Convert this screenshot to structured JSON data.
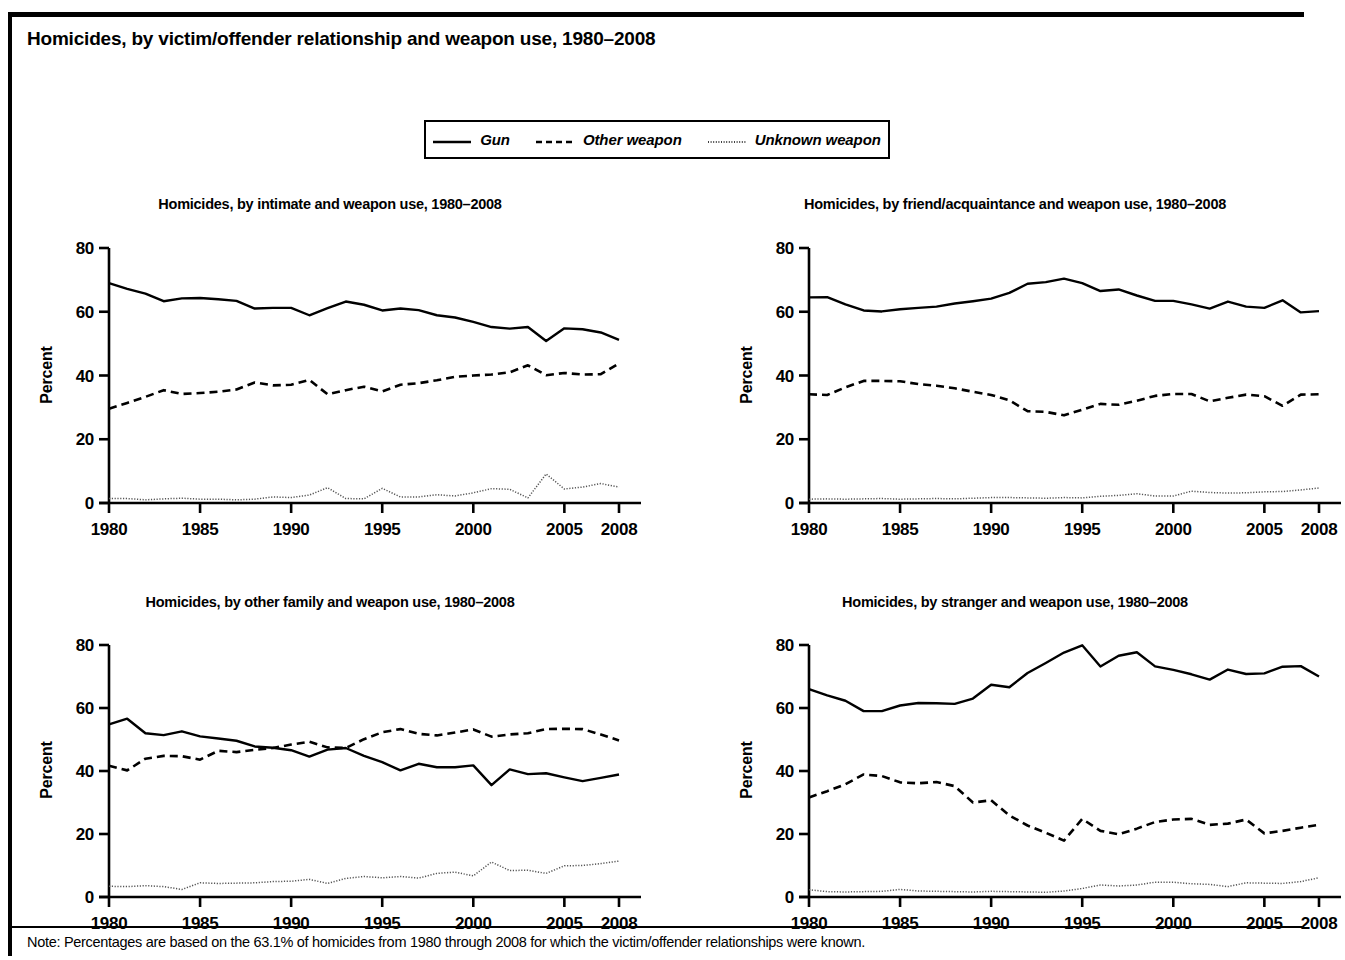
{
  "figure": {
    "title": "Homicides, by victim/offender relationship and weapon use, 1980–2008",
    "note": "Note: Percentages are based on the 63.1% of homicides from 1980 through 2008 for which the victim/offender relationships were known."
  },
  "legend": {
    "items": [
      {
        "label": "Gun",
        "style": "solid",
        "icon": "solid-line-icon"
      },
      {
        "label": "Other weapon",
        "style": "dashed",
        "icon": "dashed-line-icon"
      },
      {
        "label": "Unknown weapon",
        "style": "dotted",
        "icon": "dotted-line-icon"
      }
    ]
  },
  "axes": {
    "ylabel": "Percent",
    "yticks": [
      0,
      20,
      40,
      60,
      80
    ],
    "ylim": [
      0,
      80
    ],
    "xticks": [
      1980,
      1985,
      1990,
      1995,
      2000,
      2005,
      2008
    ],
    "xlim": [
      1980,
      2008
    ],
    "grid": false
  },
  "chart_data": [
    {
      "type": "line",
      "id": "intimate",
      "title": "Homicides, by intimate and weapon use, 1980–2008",
      "xlabel": "",
      "ylabel": "Percent",
      "ylim": [
        0,
        80
      ],
      "xlim": [
        1980,
        2008
      ],
      "grid": false,
      "legend_position": "figure-top",
      "x": [
        1980,
        1981,
        1982,
        1983,
        1984,
        1985,
        1986,
        1987,
        1988,
        1989,
        1990,
        1991,
        1992,
        1993,
        1994,
        1995,
        1996,
        1997,
        1998,
        1999,
        2000,
        2001,
        2002,
        2003,
        2004,
        2005,
        2006,
        2007,
        2008
      ],
      "series": [
        {
          "name": "Gun",
          "style": "solid",
          "values": [
            69.0,
            67.2,
            65.7,
            63.3,
            64.2,
            64.3,
            63.9,
            63.4,
            61.0,
            61.2,
            61.2,
            58.9,
            61.1,
            63.2,
            62.2,
            60.4,
            61.0,
            60.5,
            58.9,
            58.2,
            56.8,
            55.2,
            54.7,
            55.2,
            50.8,
            54.8,
            54.5,
            53.5,
            51.2
          ]
        },
        {
          "name": "Other weapon",
          "style": "dashed",
          "values": [
            29.6,
            31.4,
            33.3,
            35.4,
            34.2,
            34.5,
            34.9,
            35.6,
            37.8,
            36.9,
            37.1,
            38.6,
            34.1,
            35.4,
            36.5,
            35.0,
            37.1,
            37.6,
            38.5,
            39.6,
            40.0,
            40.3,
            41.0,
            43.2,
            40.1,
            40.8,
            40.3,
            40.4,
            43.8
          ]
        },
        {
          "name": "Unknown weapon",
          "style": "dotted",
          "values": [
            1.4,
            1.4,
            1.0,
            1.3,
            1.5,
            1.2,
            1.2,
            1.0,
            1.2,
            1.9,
            1.7,
            2.5,
            4.8,
            1.4,
            1.3,
            4.6,
            1.9,
            1.9,
            2.6,
            2.2,
            3.2,
            4.5,
            4.3,
            1.6,
            9.1,
            4.4,
            5.0,
            6.1,
            5.0
          ]
        }
      ]
    },
    {
      "type": "line",
      "id": "friend-acquaintance",
      "title": "Homicides, by friend/acquaintance and weapon use, 1980–2008",
      "xlabel": "",
      "ylabel": "Percent",
      "ylim": [
        0,
        80
      ],
      "xlim": [
        1980,
        2008
      ],
      "grid": false,
      "legend_position": "figure-top",
      "x": [
        1980,
        1981,
        1982,
        1983,
        1984,
        1985,
        1986,
        1987,
        1988,
        1989,
        1990,
        1991,
        1992,
        1993,
        1994,
        1995,
        1996,
        1997,
        1998,
        1999,
        2000,
        2001,
        2002,
        2003,
        2004,
        2005,
        2006,
        2007,
        2008
      ],
      "series": [
        {
          "name": "Gun",
          "style": "solid",
          "values": [
            64.5,
            64.6,
            62.3,
            60.4,
            60.1,
            60.8,
            61.2,
            61.6,
            62.6,
            63.3,
            64.1,
            65.9,
            68.8,
            69.3,
            70.4,
            69.0,
            66.5,
            67.0,
            65.1,
            63.4,
            63.4,
            62.3,
            61.0,
            63.2,
            61.6,
            61.2,
            63.6,
            59.8,
            60.2
          ]
        },
        {
          "name": "Other weapon",
          "style": "dashed",
          "values": [
            34.1,
            33.9,
            36.3,
            38.3,
            38.3,
            38.2,
            37.3,
            36.8,
            36.0,
            34.9,
            33.9,
            32.2,
            28.8,
            28.6,
            27.5,
            29.3,
            31.1,
            30.8,
            32.1,
            33.6,
            34.2,
            34.2,
            31.9,
            33.0,
            34.0,
            33.5,
            30.5,
            34.0,
            34.1
          ]
        },
        {
          "name": "Unknown weapon",
          "style": "dotted",
          "values": [
            1.2,
            1.3,
            1.2,
            1.3,
            1.4,
            1.2,
            1.3,
            1.4,
            1.3,
            1.5,
            1.7,
            1.7,
            1.6,
            1.5,
            1.7,
            1.6,
            2.1,
            2.4,
            2.9,
            2.2,
            2.2,
            3.7,
            3.3,
            3.1,
            3.2,
            3.5,
            3.6,
            4.1,
            4.7
          ]
        }
      ]
    },
    {
      "type": "line",
      "id": "other-family",
      "title": "Homicides, by other family and weapon use, 1980–2008",
      "xlabel": "",
      "ylabel": "Percent",
      "ylim": [
        0,
        80
      ],
      "xlim": [
        1980,
        2008
      ],
      "grid": false,
      "legend_position": "figure-top",
      "x": [
        1980,
        1981,
        1982,
        1983,
        1984,
        1985,
        1986,
        1987,
        1988,
        1989,
        1990,
        1991,
        1992,
        1993,
        1994,
        1995,
        1996,
        1997,
        1998,
        1999,
        2000,
        2001,
        2002,
        2003,
        2004,
        2005,
        2006,
        2007,
        2008
      ],
      "series": [
        {
          "name": "Gun",
          "style": "solid",
          "values": [
            54.8,
            56.6,
            52.0,
            51.4,
            52.6,
            51.0,
            50.3,
            49.6,
            47.8,
            47.4,
            46.6,
            44.6,
            46.8,
            47.3,
            44.8,
            42.8,
            40.2,
            42.3,
            41.2,
            41.2,
            41.8,
            35.5,
            40.5,
            39.0,
            39.3,
            38.0,
            36.8,
            37.8,
            38.9
          ]
        },
        {
          "name": "Other weapon",
          "style": "dashed",
          "values": [
            41.7,
            40.2,
            43.9,
            44.8,
            44.7,
            43.6,
            46.4,
            46.0,
            46.7,
            47.3,
            48.4,
            49.3,
            47.5,
            47.3,
            50.1,
            52.3,
            53.3,
            51.8,
            51.3,
            52.2,
            53.2,
            50.9,
            51.6,
            52.0,
            53.3,
            53.4,
            53.3,
            51.6,
            49.7
          ]
        },
        {
          "name": "Unknown weapon",
          "style": "dotted",
          "values": [
            3.4,
            3.3,
            3.6,
            3.3,
            2.4,
            4.5,
            4.3,
            4.4,
            4.5,
            4.9,
            5.0,
            5.6,
            4.3,
            5.9,
            6.5,
            6.1,
            6.5,
            6.0,
            7.5,
            7.9,
            6.7,
            11.1,
            8.4,
            8.5,
            7.5,
            9.9,
            10.0,
            10.6,
            11.4
          ]
        }
      ]
    },
    {
      "type": "line",
      "id": "stranger",
      "title": "Homicides, by stranger and weapon use, 1980–2008",
      "xlabel": "",
      "ylabel": "Percent",
      "ylim": [
        0,
        80
      ],
      "xlim": [
        1980,
        2008
      ],
      "grid": false,
      "legend_position": "figure-top",
      "x": [
        1980,
        1981,
        1982,
        1983,
        1984,
        1985,
        1986,
        1987,
        1988,
        1989,
        1990,
        1991,
        1992,
        1993,
        1994,
        1995,
        1996,
        1997,
        1998,
        1999,
        2000,
        2001,
        2002,
        2003,
        2004,
        2005,
        2006,
        2007,
        2008
      ],
      "series": [
        {
          "name": "Gun",
          "style": "solid",
          "values": [
            66.0,
            64.0,
            62.3,
            59.0,
            59.0,
            60.8,
            61.6,
            61.5,
            61.3,
            63.0,
            67.4,
            66.6,
            71.1,
            74.3,
            77.6,
            79.9,
            73.2,
            76.6,
            77.7,
            73.2,
            72.1,
            70.7,
            69.0,
            72.2,
            70.8,
            71.0,
            73.1,
            73.3,
            70.0
          ]
        },
        {
          "name": "Other weapon",
          "style": "dashed",
          "values": [
            31.6,
            33.6,
            35.8,
            38.9,
            38.4,
            36.4,
            36.1,
            36.5,
            35.2,
            30.0,
            30.7,
            25.9,
            22.7,
            20.4,
            17.9,
            24.8,
            21.0,
            19.9,
            21.7,
            23.8,
            24.6,
            24.8,
            22.9,
            23.3,
            24.6,
            20.2,
            21.0,
            22.0,
            22.9
          ]
        },
        {
          "name": "Unknown weapon",
          "style": "dotted",
          "values": [
            2.3,
            1.7,
            1.6,
            1.7,
            1.8,
            2.4,
            1.9,
            1.8,
            1.7,
            1.6,
            1.8,
            1.7,
            1.6,
            1.5,
            1.9,
            2.7,
            3.8,
            3.5,
            3.8,
            4.7,
            4.7,
            4.2,
            4.0,
            3.3,
            4.5,
            4.4,
            4.3,
            4.9,
            6.1
          ]
        }
      ]
    }
  ]
}
